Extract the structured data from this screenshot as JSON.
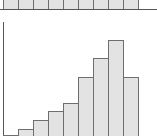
{
  "chart_data": [
    {
      "type": "bar",
      "title": "",
      "xlabel": "",
      "ylabel": "",
      "categories": [
        "1",
        "2",
        "3",
        "4",
        "5",
        "6",
        "7",
        "8",
        "9"
      ],
      "values": [
        1,
        1,
        1,
        1,
        1,
        1,
        1,
        1,
        1
      ],
      "note": "top panel cropped; only bar bottoms visible",
      "colors": {
        "fill": "#e3e3e3",
        "edge": "#6e6e6e"
      }
    },
    {
      "type": "bar",
      "title": "",
      "xlabel": "",
      "ylabel": "",
      "categories": [
        "1",
        "2",
        "3",
        "4",
        "5",
        "6",
        "7",
        "8",
        "9"
      ],
      "values": [
        0,
        7,
        16,
        25,
        33,
        59,
        78,
        96,
        59
      ],
      "ylim": [
        0,
        100
      ],
      "grid": false,
      "colors": {
        "fill": "#e3e3e3",
        "edge": "#6e6e6e"
      }
    }
  ]
}
